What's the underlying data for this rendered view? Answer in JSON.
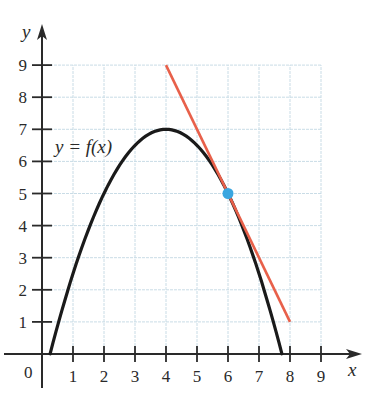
{
  "chart_data": {
    "type": "line",
    "title": "",
    "xlabel": "x",
    "ylabel": "y",
    "origin_label": "0",
    "xlim": [
      0,
      9
    ],
    "ylim": [
      0,
      9
    ],
    "x_ticks": [
      "1",
      "2",
      "3",
      "4",
      "5",
      "6",
      "7",
      "8",
      "9"
    ],
    "y_ticks": [
      "1",
      "2",
      "3",
      "4",
      "5",
      "6",
      "7",
      "8",
      "9"
    ],
    "grid": true,
    "series": [
      {
        "name": "y = f(x)",
        "label_text": "y = f(x)",
        "type": "curve",
        "color": "#1a1a1a",
        "description": "downward parabola, vertex (4, 7), x-intercepts about 0.26 and 7.74",
        "x": [
          0.26,
          1,
          2,
          3,
          4,
          5,
          6,
          7,
          7.74
        ],
        "y": [
          0,
          2.5,
          5,
          6.5,
          7,
          6.5,
          5,
          2.5,
          0
        ]
      },
      {
        "name": "tangent line at x = 6",
        "type": "line",
        "color": "#e8604a",
        "x": [
          4,
          8
        ],
        "y": [
          9,
          1
        ]
      }
    ],
    "points": [
      {
        "name": "point of tangency",
        "x": 6,
        "y": 5,
        "color": "#3aa6e0"
      }
    ]
  },
  "colors": {
    "grid": "#c9dce6",
    "axis": "#2a2a2a",
    "curve": "#1a1a1a",
    "tangent": "#e8604a",
    "point": "#3aa6e0"
  }
}
